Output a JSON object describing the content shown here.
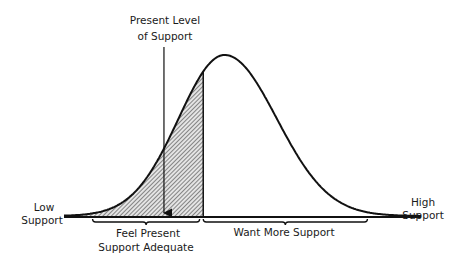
{
  "chart_data": {
    "type": "area",
    "title": "",
    "xlabel": "",
    "ylabel": "",
    "x_axis_ends": {
      "left": [
        "Low",
        "Support"
      ],
      "right": [
        "High",
        "Support"
      ]
    },
    "distribution": {
      "shape": "skewed-bell",
      "mean": 0.45,
      "xlim": [
        0,
        1
      ]
    },
    "present_level": {
      "x": 0.28,
      "label": [
        "Present Level",
        "of Support"
      ]
    },
    "shaded_region": {
      "from": 0.0,
      "to": 0.39,
      "pattern": "diagonal-hatch"
    },
    "brackets": [
      {
        "from": 0.08,
        "to": 0.38,
        "label": [
          "Feel Present",
          "Support Adequate"
        ]
      },
      {
        "from": 0.39,
        "to": 0.85,
        "label": [
          "Want More Support"
        ]
      }
    ],
    "colors": {
      "stroke": "#111111",
      "hatch": "#333333",
      "fill": "#d8d8d8"
    }
  }
}
